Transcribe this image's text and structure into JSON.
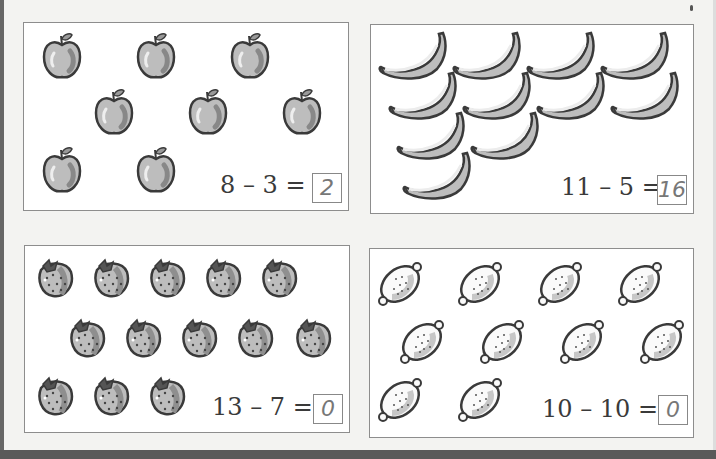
{
  "worksheet": {
    "panels": [
      {
        "id": "apples",
        "fruit": "apple",
        "count": 8,
        "equation": "8 – 3 =",
        "answer": "2"
      },
      {
        "id": "bananas",
        "fruit": "banana",
        "count": 11,
        "equation": "11 – 5 =",
        "answer": "16"
      },
      {
        "id": "strawberries",
        "fruit": "strawberry",
        "count": 13,
        "equation": "13 – 7 =",
        "answer": "0"
      },
      {
        "id": "lemons",
        "fruit": "lemon",
        "count": 10,
        "equation": "10 – 10 =",
        "answer": "0"
      }
    ]
  },
  "colors": {
    "paper": "#ffffff",
    "fruit_fill": "#bdbdbd",
    "outline": "#3a3a3a",
    "border": "#8d8d8d"
  }
}
